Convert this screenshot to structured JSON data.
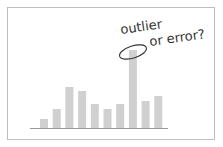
{
  "chart_data": {
    "type": "bar",
    "title": "",
    "xlabel": "",
    "ylabel": "",
    "categories": [
      "1",
      "2",
      "3",
      "4",
      "5",
      "6",
      "7",
      "8",
      "9",
      "10"
    ],
    "values": [
      9,
      19,
      41,
      37,
      24,
      19,
      24,
      78,
      27,
      32
    ],
    "ylim": [
      0,
      100
    ],
    "grid": false,
    "bar_color": "#d0d0d0",
    "annotations": [
      {
        "text_line1": "outlier",
        "text_line2": "or error?",
        "target_index": 7,
        "shape": "ellipse"
      }
    ]
  }
}
